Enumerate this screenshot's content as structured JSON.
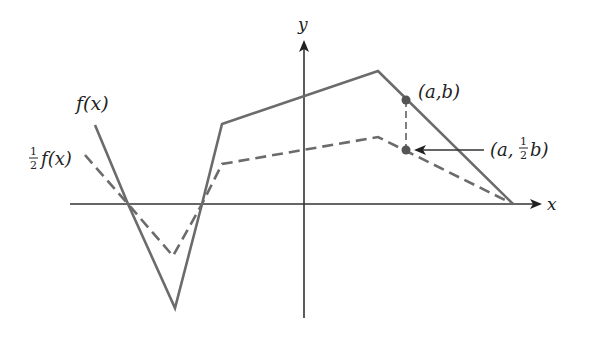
{
  "diagram": {
    "title": "",
    "axes": {
      "x_label": "x",
      "y_label": "y"
    },
    "curves": [
      {
        "name": "f(x)",
        "label": "f(x)",
        "style": "solid",
        "color": "#6b6b6b",
        "points": [
          [
            95,
            125
          ],
          [
            128,
            204
          ],
          [
            175,
            308
          ],
          [
            202,
            204
          ],
          [
            222,
            124
          ],
          [
            378,
            71
          ],
          [
            513,
            204
          ]
        ]
      },
      {
        "name": "half-f(x)",
        "label_fraction": "1/2",
        "label_suffix": "f(x)",
        "style": "dashed",
        "color": "#6b6b6b",
        "points": [
          [
            85,
            155
          ],
          [
            128,
            204
          ],
          [
            173,
            256
          ],
          [
            202,
            204
          ],
          [
            222,
            164
          ],
          [
            378,
            137
          ],
          [
            513,
            204
          ]
        ]
      }
    ],
    "points": [
      {
        "name": "point-a-b",
        "label": "(a,b)",
        "x": 406,
        "y": 100
      },
      {
        "name": "point-a-half-b",
        "label_prefix": "(a,",
        "label_fraction": "1/2",
        "label_suffix": "b)",
        "x": 406,
        "y": 150
      }
    ],
    "annotations": {
      "arrow_to_half_point": "arrow from label (a, ½b) pointing to the halved point",
      "vertical_dashed_connector": "dashed segment from (a,b) to (a,½b)"
    },
    "colors": {
      "curve": "#6b6b6b",
      "axis": "#333333",
      "point": "#555555"
    }
  }
}
